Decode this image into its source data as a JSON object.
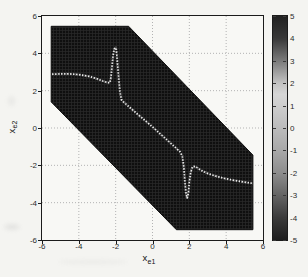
{
  "figure": {
    "kind": "matlab-pcolor-figure",
    "background": "#f4f4f1"
  },
  "chart_data": {
    "type": "heatmap",
    "title": "",
    "xlabel": "x_e1",
    "ylabel": "x_e2",
    "xlabel_parts": {
      "base": "x",
      "sub": "e1"
    },
    "ylabel_parts": {
      "base": "x",
      "sub": "e2"
    },
    "xlim": [
      -6,
      6
    ],
    "ylim": [
      -6,
      6
    ],
    "xticks": [
      -6,
      -4,
      -2,
      0,
      2,
      4,
      6
    ],
    "yticks": [
      6,
      4,
      2,
      0,
      -2,
      -4,
      -6
    ],
    "grid": true,
    "grid_style": "dotted",
    "colors": {
      "region_dark": "#0f0f0f",
      "region_cell_line": "#2a2a2a",
      "curve_light": "#ececec",
      "curve_halo": "#8a8a8a",
      "gridline": "#b3b3b3",
      "axis": "#1b1b1b",
      "plot_background": "#f8f8f5"
    },
    "colorbar": {
      "position": "right",
      "min": -5,
      "max": 5,
      "ticks": [
        5,
        4,
        3,
        2,
        1,
        0,
        -1,
        -2,
        -3,
        -4,
        -5
      ],
      "gradient_stops": [
        {
          "value": 5,
          "color": "#212121"
        },
        {
          "value": 4,
          "color": "#383838"
        },
        {
          "value": 3,
          "color": "#7a7a7a"
        },
        {
          "value": 2,
          "color": "#c2c2c2"
        },
        {
          "value": 1.5,
          "color": "#d6d6d6"
        },
        {
          "value": 1,
          "color": "#cecece"
        },
        {
          "value": 0,
          "color": "#bcbcbc"
        },
        {
          "value": -1,
          "color": "#a8a8a8"
        },
        {
          "value": -2,
          "color": "#8d8d8d"
        },
        {
          "value": -3,
          "color": "#646464"
        },
        {
          "value": -4,
          "color": "#3a3a3a"
        },
        {
          "value": -5,
          "color": "#1d1d1d"
        }
      ]
    },
    "region_polygon": [
      [
        -5.5,
        5.45
      ],
      [
        -1.3,
        5.45
      ],
      [
        5.45,
        -1.45
      ],
      [
        5.45,
        -5.45
      ],
      [
        1.3,
        -5.45
      ],
      [
        -5.5,
        1.4
      ]
    ],
    "region_value_note": "saturated dark region, |value| ≈ 5",
    "zero_curve_note": "light curve where value ≈ 0",
    "zero_curve_points": [
      [
        -5.45,
        2.88
      ],
      [
        -5.0,
        2.9
      ],
      [
        -4.5,
        2.9
      ],
      [
        -4.0,
        2.86
      ],
      [
        -3.5,
        2.78
      ],
      [
        -3.05,
        2.65
      ],
      [
        -2.7,
        2.52
      ],
      [
        -2.45,
        2.43
      ],
      [
        -2.32,
        2.42
      ],
      [
        -2.26,
        2.7
      ],
      [
        -2.2,
        3.3
      ],
      [
        -2.14,
        3.9
      ],
      [
        -2.07,
        4.25
      ],
      [
        -1.99,
        4.3
      ],
      [
        -1.94,
        3.95
      ],
      [
        -1.89,
        3.3
      ],
      [
        -1.83,
        2.6
      ],
      [
        -1.77,
        1.95
      ],
      [
        -1.69,
        1.52
      ],
      [
        -1.55,
        1.37
      ],
      [
        -1.2,
        1.07
      ],
      [
        -0.8,
        0.73
      ],
      [
        -0.4,
        0.4
      ],
      [
        0.0,
        0.06
      ],
      [
        0.4,
        -0.3
      ],
      [
        0.8,
        -0.65
      ],
      [
        1.2,
        -1.0
      ],
      [
        1.5,
        -1.28
      ],
      [
        1.62,
        -1.5
      ],
      [
        1.7,
        -2.1
      ],
      [
        1.76,
        -2.9
      ],
      [
        1.82,
        -3.5
      ],
      [
        1.88,
        -3.75
      ],
      [
        1.95,
        -3.5
      ],
      [
        2.0,
        -2.9
      ],
      [
        2.07,
        -2.4
      ],
      [
        2.17,
        -2.08
      ],
      [
        2.32,
        -2.05
      ],
      [
        2.6,
        -2.25
      ],
      [
        3.0,
        -2.44
      ],
      [
        3.5,
        -2.6
      ],
      [
        4.0,
        -2.72
      ],
      [
        4.5,
        -2.82
      ],
      [
        5.0,
        -2.9
      ],
      [
        5.45,
        -2.97
      ]
    ]
  }
}
